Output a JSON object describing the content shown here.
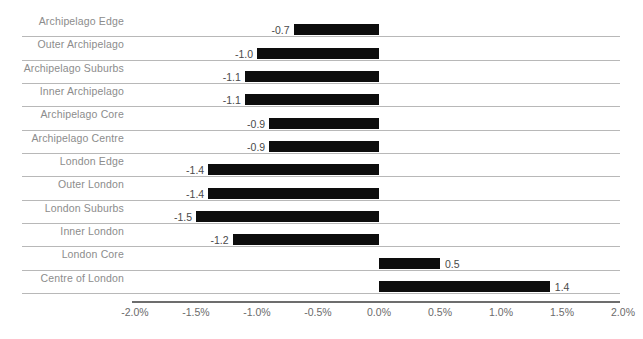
{
  "chart_data": {
    "type": "bar",
    "orientation": "horizontal",
    "title": "",
    "xlabel": "",
    "ylabel": "",
    "xlim": [
      -2.0,
      2.0
    ],
    "xticks": [
      -2.0,
      -1.5,
      -1.0,
      -0.5,
      0.0,
      0.5,
      1.0,
      1.5,
      2.0
    ],
    "xtick_labels": [
      "-2.0%",
      "-1.5%",
      "-1.0%",
      "-0.5%",
      "0.0%",
      "0.5%",
      "1.0%",
      "1.5%",
      "2.0%"
    ],
    "grid": true,
    "legend": "none",
    "bar_color": "#0d0d0d",
    "gridline_color": "#b8b8b8",
    "label_color": "#8c8c8c",
    "categories": [
      "Archipelago Edge",
      "Outer Archipelago",
      "Archipelago Suburbs",
      "Inner Archipelago",
      "Archipelago Core",
      "Archipelago Centre",
      "London Edge",
      "Outer London",
      "London Suburbs",
      "Inner London",
      "London Core",
      "Centre of London"
    ],
    "values": [
      -0.7,
      -1.0,
      -1.1,
      -1.1,
      -0.9,
      -0.9,
      -1.4,
      -1.4,
      -1.5,
      -1.2,
      0.5,
      1.4
    ],
    "value_labels": [
      "-0.7",
      "-1.0",
      "-1.1",
      "-1.1",
      "-0.9",
      "-0.9",
      "-1.4",
      "-1.4",
      "-1.5",
      "-1.2",
      "0.5",
      "1.4"
    ]
  }
}
